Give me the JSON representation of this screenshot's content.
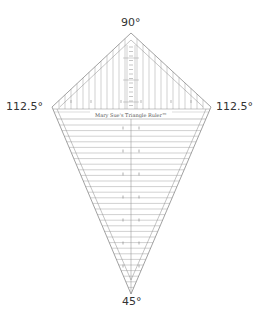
{
  "angles": {
    "top": "90°",
    "left": "112.5°",
    "right": "112.5°",
    "bottom": "45°"
  },
  "ruler": {
    "label": "Mary Sue's Triangle Ruler™",
    "line_color": "#8a8a8a",
    "vertices": {
      "top": [
        131,
        33
      ],
      "left": [
        52,
        107
      ],
      "right": [
        211,
        107
      ],
      "bottom": [
        131,
        294
      ]
    }
  }
}
